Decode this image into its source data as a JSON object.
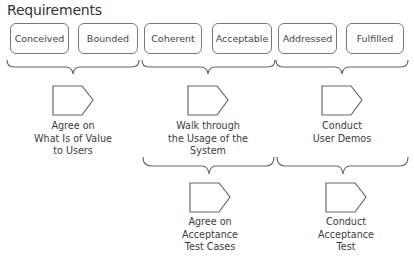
{
  "title": "Requirements",
  "requirements": [
    {
      "label": "Conceived",
      "x": 10,
      "w": 59
    },
    {
      "label": "Bounded",
      "x": 78,
      "w": 60
    },
    {
      "label": "Coherent",
      "x": 144,
      "w": 58
    },
    {
      "label": "Acceptable",
      "x": 212,
      "w": 60
    },
    {
      "label": "Addressed",
      "x": 278,
      "w": 59
    },
    {
      "label": "Fulfilled",
      "x": 346,
      "w": 58
    }
  ],
  "activities": [
    {
      "lines": [
        "Agree on",
        "What Is of Value",
        "to Users"
      ]
    },
    {
      "lines": [
        "Walk through",
        "the Usage of the",
        "System"
      ]
    },
    {
      "lines": [
        "Conduct",
        "User Demos"
      ]
    },
    {
      "lines": [
        "Agree on",
        "Acceptance",
        "Test Cases"
      ]
    },
    {
      "lines": [
        "Conduct",
        "Acceptance",
        "Test"
      ]
    }
  ]
}
